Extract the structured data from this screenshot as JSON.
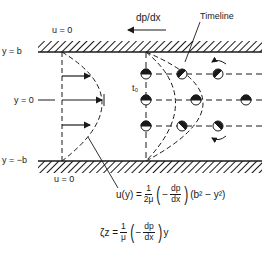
{
  "labels": {
    "top_wall_bc": "u = 0",
    "bottom_wall_bc": "u = 0",
    "pressure_gradient": "dp/dx",
    "timeline": "Timeline",
    "y_top": "y = b",
    "y_center": "y = 0",
    "y_bottom": "y = −b",
    "t0": "t₀"
  },
  "velocity_equation": {
    "lhs": "u(y) =",
    "coef_num": "1",
    "coef_den": "2μ",
    "grad_sign": "−",
    "grad_num": "dp",
    "grad_den": "dx",
    "tail": "(b² − y²)"
  },
  "vorticity_equation": {
    "lhs": "ζz =",
    "coef_num": "1",
    "coef_den": "μ",
    "grad_sign": "−",
    "grad_num": "dp",
    "grad_den": "dx",
    "tail": "y"
  },
  "colors": {
    "ink": "#1a1a1a",
    "background": "#ffffff"
  }
}
